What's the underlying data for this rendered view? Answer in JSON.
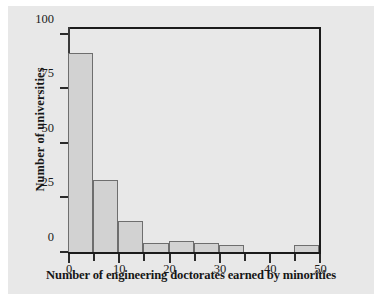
{
  "chart_data": {
    "type": "bar",
    "title": "",
    "subtitle": "",
    "xlabel": "Number of engineering doctorates earned by minorities",
    "ylabel": "Number of universities",
    "xlim": [
      0,
      50.3
    ],
    "ylim": [
      0,
      104
    ],
    "grid": false,
    "legend": null,
    "bin_width": 5,
    "bins": [
      {
        "start": 0,
        "end": 5,
        "value": 91
      },
      {
        "start": 5,
        "end": 10,
        "value": 33
      },
      {
        "start": 10,
        "end": 15,
        "value": 14
      },
      {
        "start": 15,
        "end": 20,
        "value": 4
      },
      {
        "start": 20,
        "end": 25,
        "value": 5
      },
      {
        "start": 25,
        "end": 30,
        "value": 4
      },
      {
        "start": 30,
        "end": 35,
        "value": 3
      },
      {
        "start": 35,
        "end": 40,
        "value": 0
      },
      {
        "start": 40,
        "end": 45,
        "value": 0
      },
      {
        "start": 45,
        "end": 50,
        "value": 3
      }
    ],
    "categories": [
      "0-5",
      "5-10",
      "10-15",
      "15-20",
      "20-25",
      "25-30",
      "30-35",
      "35-40",
      "40-45",
      "45-50"
    ],
    "values": [
      91,
      33,
      14,
      4,
      5,
      4,
      3,
      0,
      0,
      3
    ],
    "yticks": [
      {
        "value": 0,
        "label": "0"
      },
      {
        "value": 25,
        "label": "25"
      },
      {
        "value": 50,
        "label": "50"
      },
      {
        "value": 75,
        "label": "75"
      },
      {
        "value": 100,
        "label": "100"
      }
    ],
    "xticks_labeled": [
      {
        "value": 0,
        "label": "0"
      },
      {
        "value": 10,
        "label": "10"
      },
      {
        "value": 20,
        "label": "20"
      },
      {
        "value": 30,
        "label": "30"
      },
      {
        "value": 40,
        "label": "40"
      },
      {
        "value": 50,
        "label": "50"
      }
    ],
    "xticks_minor": [
      5,
      15,
      25,
      35,
      45
    ],
    "colors": {
      "bar_fill": "#d2d2d2",
      "bar_edge": "#6e6e6e",
      "axis": "#1b1b1b",
      "text": "#161616",
      "plot_background": "#ffffff",
      "figure_background": "#e8e8e8",
      "page_background": "#ffffff"
    }
  }
}
